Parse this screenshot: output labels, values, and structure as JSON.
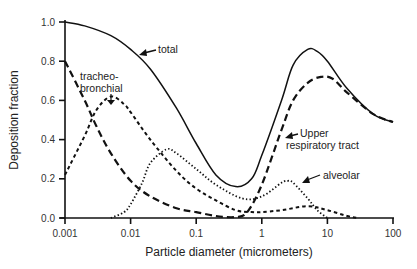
{
  "chart_data": {
    "type": "line",
    "title": "",
    "xlabel": "Particle diameter (micrometers)",
    "ylabel": "Deposition fraction",
    "xscale": "log",
    "xlim": [
      0.001,
      100
    ],
    "ylim": [
      0.0,
      1.0
    ],
    "x_ticks": [
      "0.001",
      "0.01",
      "0.1",
      "1",
      "10",
      "100"
    ],
    "y_ticks": [
      "0.0",
      "0.2",
      "0.4",
      "0.6",
      "0.8",
      "1.0"
    ],
    "grid": false,
    "legend": "none (inline annotations with arrows)",
    "series": [
      {
        "name": "total",
        "style": "solid",
        "x": [
          0.001,
          0.002,
          0.005,
          0.01,
          0.02,
          0.05,
          0.1,
          0.2,
          0.4,
          0.7,
          1,
          2,
          3,
          5,
          7,
          10,
          20,
          50,
          100
        ],
        "y": [
          1.0,
          0.98,
          0.93,
          0.86,
          0.76,
          0.56,
          0.38,
          0.22,
          0.16,
          0.2,
          0.32,
          0.6,
          0.78,
          0.86,
          0.85,
          0.8,
          0.66,
          0.53,
          0.49
        ]
      },
      {
        "name": "Upper respiratory tract",
        "style": "long-dash",
        "x": [
          0.001,
          0.002,
          0.003,
          0.005,
          0.01,
          0.02,
          0.05,
          0.1,
          0.2,
          0.4,
          0.6,
          1,
          2,
          3,
          5,
          8,
          12,
          20,
          50,
          100
        ],
        "y": [
          0.8,
          0.6,
          0.47,
          0.33,
          0.19,
          0.11,
          0.05,
          0.03,
          0.01,
          0.005,
          0.03,
          0.17,
          0.45,
          0.6,
          0.69,
          0.72,
          0.71,
          0.64,
          0.53,
          0.49
        ]
      },
      {
        "name": "tracheo-bronchial",
        "style": "short-dash",
        "x": [
          0.001,
          0.002,
          0.003,
          0.005,
          0.008,
          0.01,
          0.02,
          0.05,
          0.1,
          0.2,
          0.4,
          0.7,
          1,
          2,
          5,
          10,
          20,
          30
        ],
        "y": [
          0.22,
          0.42,
          0.55,
          0.62,
          0.58,
          0.54,
          0.4,
          0.24,
          0.15,
          0.09,
          0.04,
          0.03,
          0.03,
          0.04,
          0.06,
          0.04,
          0.01,
          0.0
        ]
      },
      {
        "name": "alveolar",
        "style": "dotted",
        "x": [
          0.005,
          0.008,
          0.01,
          0.015,
          0.02,
          0.035,
          0.05,
          0.1,
          0.2,
          0.5,
          1,
          2,
          2.5,
          3,
          5,
          7,
          10
        ],
        "y": [
          0.0,
          0.03,
          0.07,
          0.18,
          0.28,
          0.35,
          0.33,
          0.25,
          0.17,
          0.1,
          0.11,
          0.18,
          0.19,
          0.18,
          0.1,
          0.04,
          0.0
        ]
      }
    ],
    "annotations": [
      {
        "text": "total",
        "x": 0.03,
        "y": 0.87
      },
      {
        "text": "tracheo-",
        "line2": "bronchial",
        "x": 0.005,
        "y": 0.72
      },
      {
        "text": "Upper",
        "line2": "respiratory tract",
        "x": 1.3,
        "y": 0.37
      },
      {
        "text": "alveolar",
        "x": 4.5,
        "y": 0.2
      }
    ]
  }
}
